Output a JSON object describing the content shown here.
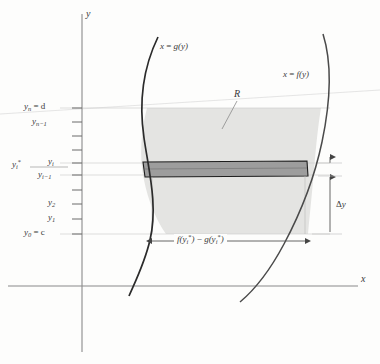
{
  "figure": {
    "type": "calculus-region-diagram",
    "background_color": "#fdfdfc",
    "curve_color": "#2b2b2b",
    "region_fill": "#e2e2e2",
    "strip_fill": "#9a9a9a",
    "gridline_color": "#c9c9c9",
    "axis_color": "#8a8a8a",
    "text_color": "#3a3a3a"
  },
  "axes": {
    "y_axis_label": "y",
    "x_axis_label": "x"
  },
  "curves": {
    "left": {
      "label_x": "x",
      "label_eq": "=",
      "label_fn": "g(y)",
      "name": "x = g(y)"
    },
    "right": {
      "label_x": "x",
      "label_eq": "=",
      "label_fn": "f(y)",
      "name": "x = f(y)"
    }
  },
  "region": {
    "label": "R"
  },
  "y_ticks": [
    {
      "id": "yn",
      "base": "y",
      "sub": "n",
      "eq": " = d"
    },
    {
      "id": "yn1",
      "base": "y",
      "sub": "n−1",
      "eq": ""
    },
    {
      "id": "yi",
      "base": "y",
      "sub": "i",
      "eq": ""
    },
    {
      "id": "yi1",
      "base": "y",
      "sub": "i−1",
      "eq": ""
    },
    {
      "id": "y2",
      "base": "y",
      "sub": "2",
      "eq": ""
    },
    {
      "id": "y1",
      "base": "y",
      "sub": "1",
      "eq": ""
    },
    {
      "id": "y0",
      "base": "y",
      "sub": "0",
      "eq": " = c"
    }
  ],
  "sample_point": {
    "base": "y",
    "sub": "i",
    "star": "*"
  },
  "annotations": {
    "width": {
      "f_base": "f(y",
      "f_sub": "i",
      "f_star": "*",
      "f_close": ")",
      "minus": " − ",
      "g_base": "g(y",
      "g_sub": "i",
      "g_star": "*",
      "g_close": ")"
    },
    "thickness": {
      "delta": "Δ",
      "var": "y"
    }
  }
}
